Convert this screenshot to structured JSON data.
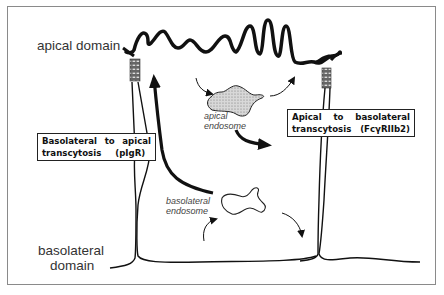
{
  "diagram": {
    "labels": {
      "apical_domain": "apical domain",
      "basolateral_domain_line1": "basolateral",
      "basolateral_domain_line2": "domain",
      "apical_endosome_line1": "apical",
      "apical_endosome_line2": "endosome",
      "basolateral_endosome_line1": "basolateral",
      "basolateral_endosome_line2": "endosome"
    },
    "boxes": {
      "basolateral_to_apical": {
        "line1": [
          "Basolateral",
          "to",
          "apical"
        ],
        "line2": [
          "transcytosis",
          "(pIgR)"
        ]
      },
      "apical_to_basolateral": {
        "line1": [
          "Apical",
          "to",
          "basolateral"
        ],
        "line2": [
          "transcytosis",
          "(FcγRIIb2)"
        ]
      }
    },
    "colors": {
      "ink": "#111111",
      "frame": "#8a8a8a",
      "junction": "#555555"
    }
  }
}
